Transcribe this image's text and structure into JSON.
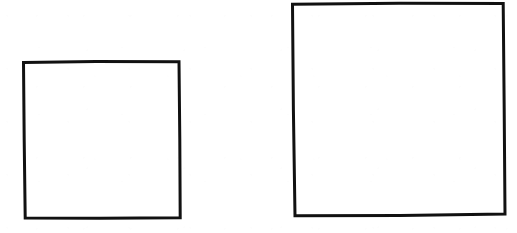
{
  "document": {
    "title": "Two hand-drawn squares",
    "background_color": "#ffffff",
    "ink_color": "#111111",
    "width": 517,
    "height": 233,
    "caption": ""
  },
  "figure": {
    "stroke_width": 3,
    "shape_count": 2,
    "shapes": [
      {
        "id": "small-square",
        "label": "small square",
        "kind": "square",
        "fill": "none",
        "stroke_color": "#111111",
        "stroke_width": 3,
        "approx_side_px": 156,
        "bounds": {
          "x": 23,
          "y": 61,
          "width": 158,
          "height": 158
        },
        "corners": {
          "top_left": [
            23,
            62
          ],
          "top_right": [
            179,
            61
          ],
          "bottom_right": [
            180,
            218
          ],
          "bottom_left": [
            25,
            218
          ]
        },
        "path": "M 23.5 62.5 L 96 61.4 L 179 61.8 L 179.8 140 L 180.2 217.8 L 100 218.2 L 25.2 218.0 L 24.2 140 Z"
      },
      {
        "id": "large-square",
        "label": "large square",
        "kind": "square",
        "fill": "none",
        "stroke_color": "#111111",
        "stroke_width": 3,
        "approx_side_px": 211,
        "bounds": {
          "x": 292,
          "y": 3,
          "width": 214,
          "height": 214
        },
        "corners": {
          "top_left": [
            292,
            4
          ],
          "top_right": [
            503,
            3
          ],
          "bottom_right": [
            505,
            214
          ],
          "bottom_left": [
            295,
            216
          ]
        },
        "path": "M 292.5 4.2 L 400 3.2 L 503.2 3.4 L 504.2 110 L 505.0 214.0 L 400 215.6 L 295.0 215.8 L 293.4 110 Z"
      }
    ]
  }
}
